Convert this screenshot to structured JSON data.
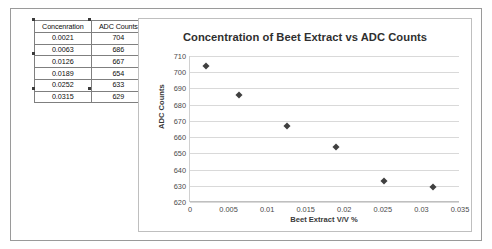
{
  "table": {
    "headers": [
      "Concenration",
      "ADC Counts"
    ],
    "rows": [
      [
        "0.0021",
        "704"
      ],
      [
        "0.0063",
        "686"
      ],
      [
        "0.0126",
        "667"
      ],
      [
        "0.0189",
        "654"
      ],
      [
        "0.0252",
        "633"
      ],
      [
        "0.0315",
        "629"
      ]
    ]
  },
  "chart_data": {
    "type": "scatter",
    "title": "Concentration of Beet Extract vs ADC Counts",
    "xlabel": "Beet Extract V/V %",
    "ylabel": "ADC Counts",
    "x": [
      0.0021,
      0.0063,
      0.0126,
      0.0189,
      0.0252,
      0.0315
    ],
    "values": [
      704,
      686,
      667,
      654,
      633,
      629
    ],
    "series": [
      {
        "name": "ADC Counts",
        "x": [
          0.0021,
          0.0063,
          0.0126,
          0.0189,
          0.0252,
          0.0315
        ],
        "values": [
          704,
          686,
          667,
          654,
          633,
          629
        ]
      }
    ],
    "xlim": [
      0,
      0.035
    ],
    "ylim": [
      620,
      710
    ],
    "xticks": [
      "0",
      "0.005",
      "0.01",
      "0.015",
      "0.02",
      "0.025",
      "0.03",
      "0.035"
    ],
    "xtick_values": [
      0,
      0.005,
      0.01,
      0.015,
      0.02,
      0.025,
      0.03,
      0.035
    ],
    "yticks": [
      "620",
      "630",
      "640",
      "650",
      "660",
      "670",
      "680",
      "690",
      "700",
      "710"
    ],
    "ytick_values": [
      620,
      630,
      640,
      650,
      660,
      670,
      680,
      690,
      700,
      710
    ],
    "grid": "horizontal",
    "legend": "none",
    "marker_color": "#404040",
    "gridline_color": "#d9d9d9"
  }
}
